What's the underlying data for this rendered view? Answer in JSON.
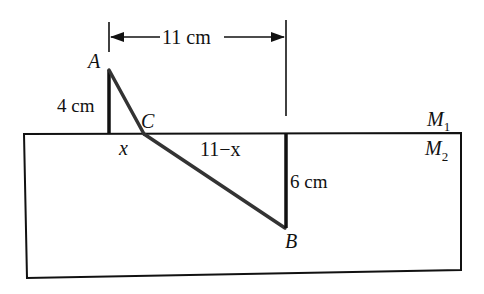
{
  "diagram": {
    "dimension_label": "11 cm",
    "points": {
      "A": "A",
      "B": "B",
      "C": "C"
    },
    "segments": {
      "left_height": "4 cm",
      "right_height": "6 cm",
      "left_base": "x",
      "right_base": "11−x"
    },
    "media": {
      "upper": "M",
      "upper_sub": "1",
      "lower": "M",
      "lower_sub": "2"
    }
  }
}
